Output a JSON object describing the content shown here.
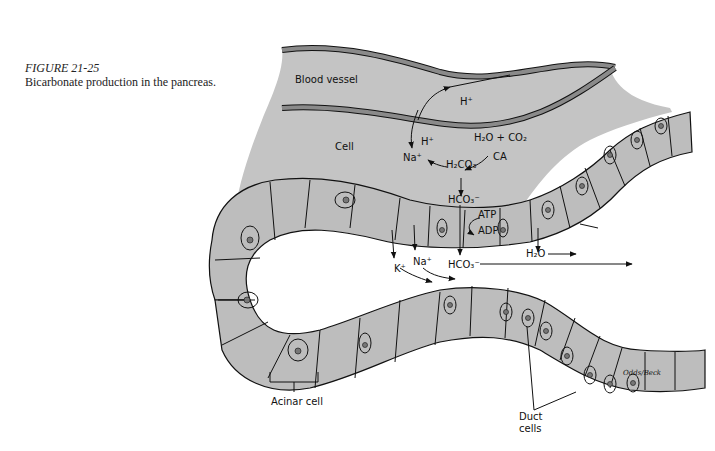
{
  "caption": {
    "figure_number": "FIGURE 21-25",
    "description": "Bicarbonate production in the pancreas."
  },
  "labels": {
    "blood_vessel": "Blood vessel",
    "cell": "Cell",
    "h_plus_top": "H⁺",
    "h_plus_inner": "H⁺",
    "na_plus_cell": "Na⁺",
    "h2o_co2": "H₂O + CO₂",
    "ca": "CA",
    "h2co3": "H₂CO₃",
    "hco3_cell": "HCO₃⁻",
    "atp": "ATP",
    "adp": "ADP",
    "k_plus": "K⁺",
    "na_plus_lumen": "Na⁺",
    "hco3_lumen": "HCO₃⁻",
    "h2o_lumen": "H₂O",
    "acinar_cell": "Acinar cell",
    "duct_cells_line1": "Duct",
    "duct_cells_line2": "cells",
    "artist_signature": "Odds/Beck"
  },
  "colors": {
    "tissue": "#bdbdbd",
    "vessel_wall": "#8a8a8a",
    "outline": "#111111"
  }
}
